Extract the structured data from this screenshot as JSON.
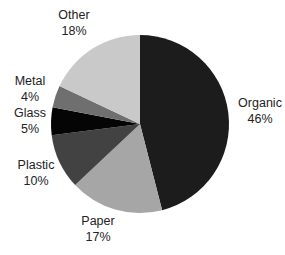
{
  "chart_data": {
    "type": "pie",
    "title": "",
    "start_angle_deg": 0,
    "direction": "clockwise",
    "slices": [
      {
        "label": "Organic",
        "value": 46,
        "display": "46%",
        "color": "#1c1c1c"
      },
      {
        "label": "Paper",
        "value": 17,
        "display": "17%",
        "color": "#a6a6a6"
      },
      {
        "label": "Plastic",
        "value": 10,
        "display": "10%",
        "color": "#424242"
      },
      {
        "label": "Glass",
        "value": 5,
        "display": "5%",
        "color": "#050505"
      },
      {
        "label": "Metal",
        "value": 4,
        "display": "4%",
        "color": "#6f6f6f"
      },
      {
        "label": "Other",
        "value": 18,
        "display": "18%",
        "color": "#c9c9c9"
      }
    ],
    "categories": [
      "Organic",
      "Paper",
      "Plastic",
      "Glass",
      "Metal",
      "Other"
    ],
    "values": [
      46,
      17,
      10,
      5,
      4,
      18
    ],
    "legend": "none (data labels outside slices)"
  },
  "labels": {
    "organic": {
      "name": "Organic",
      "pct": "46%"
    },
    "paper": {
      "name": "Paper",
      "pct": "17%"
    },
    "plastic": {
      "name": "Plastic",
      "pct": "10%"
    },
    "glass": {
      "name": "Glass",
      "pct": "5%"
    },
    "metal": {
      "name": "Metal",
      "pct": "4%"
    },
    "other": {
      "name": "Other",
      "pct": "18%"
    }
  }
}
